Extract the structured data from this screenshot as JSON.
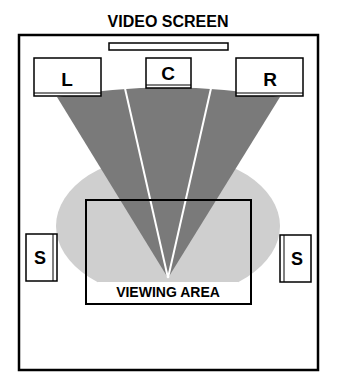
{
  "title": "VIDEO SCREEN",
  "speakers": {
    "left": "L",
    "center": "C",
    "right": "R",
    "surround_left": "S",
    "surround_right": "S"
  },
  "viewing_area_label": "VIEWING AREA",
  "colors": {
    "fan": "#7a7a7a",
    "ellipse": "#cfcfcf",
    "stroke": "#000000",
    "divider": "#ffffff"
  }
}
